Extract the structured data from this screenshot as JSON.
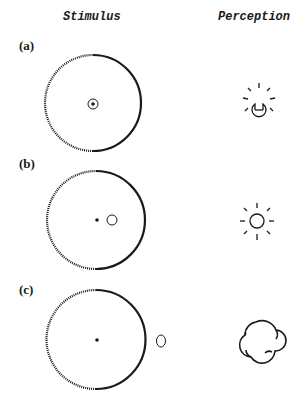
{
  "headers": {
    "stimulus": "Stimulus",
    "perception": "Perception"
  },
  "panels": [
    {
      "label": "(a)",
      "stimulus": "large circle (left half dashed, right half solid) with small ringed dot at center",
      "perception_icon": "keyhole-lightbulb-icon"
    },
    {
      "label": "(b)",
      "stimulus": "large circle with center dot and small circle just right of center",
      "perception_icon": "sun-icon"
    },
    {
      "label": "(c)",
      "stimulus": "large circle with center dot and small oval outside the circle on the right",
      "perception_icon": "cloud-icon"
    }
  ],
  "colors": {
    "ink": "#1a1a1a",
    "background": "#ffffff"
  }
}
